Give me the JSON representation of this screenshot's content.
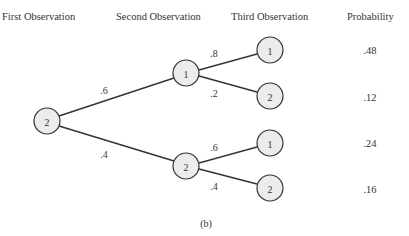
{
  "headers": {
    "first": "First Observation",
    "second": "Second Observation",
    "third": "Third Observation",
    "probability": "Probability"
  },
  "nodes": {
    "root": "2",
    "second_top": "1",
    "second_bottom": "2",
    "third_1": "1",
    "third_2": "2",
    "third_3": "1",
    "third_4": "2"
  },
  "edges": {
    "root_to_top": ".6",
    "root_to_bottom": ".4",
    "top_to_1": ".8",
    "top_to_2": ".2",
    "bottom_to_1": ".6",
    "bottom_to_2": ".4"
  },
  "probabilities": [
    ".48",
    ".12",
    ".24",
    ".16"
  ],
  "caption": "(b)",
  "colors": {
    "node_fill": "#ececec",
    "stroke": "#333333"
  }
}
